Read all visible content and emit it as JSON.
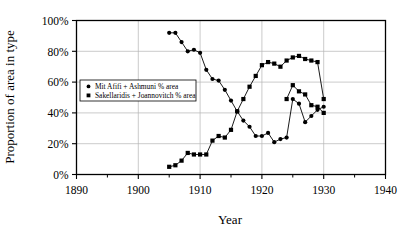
{
  "chart_data": {
    "type": "line",
    "title": "",
    "xlabel": "Year",
    "ylabel": "Proportion of area in type",
    "xlim": [
      1890,
      1940
    ],
    "ylim": [
      0,
      100
    ],
    "xticks": [
      1890,
      1900,
      1910,
      1920,
      1930,
      1940
    ],
    "xtick_labels": [
      "1890",
      "1900",
      "1910",
      "1920",
      "1930",
      "1940"
    ],
    "x_minor_ticks": [
      1895,
      1905,
      1915,
      1925,
      1935
    ],
    "yticks": [
      0,
      20,
      40,
      60,
      80,
      100
    ],
    "ytick_labels": [
      "0%",
      "20%",
      "40%",
      "60%",
      "80%",
      "100%"
    ],
    "grid": true,
    "legend_position": "center-left-inside",
    "marker_color": "#000000",
    "line_color": "#000000",
    "axis_color": "#000000",
    "grid_color": "#b4b4b4",
    "background_color": "#ffffff",
    "series": [
      {
        "name": "Mit Afifi + Ashmuni % area",
        "marker": "circle",
        "x": [
          1905,
          1906,
          1907,
          1908,
          1909,
          1910,
          1911,
          1912,
          1913,
          1914,
          1915,
          1916,
          1917,
          1918,
          1919,
          1920,
          1921,
          1922,
          1923,
          1924,
          1925,
          1926,
          1927,
          1928,
          1929,
          1930
        ],
        "values": [
          92,
          92,
          86,
          80,
          81,
          79,
          68,
          62,
          61,
          55,
          48,
          41,
          35,
          31,
          25,
          25,
          27,
          21,
          23,
          24,
          49,
          46,
          34,
          38,
          42,
          44
        ]
      },
      {
        "name": "Sakellaridis + Joannovitch % area",
        "marker": "square",
        "x": [
          1905,
          1906,
          1907,
          1908,
          1909,
          1910,
          1911,
          1912,
          1913,
          1914,
          1915,
          1916,
          1917,
          1918,
          1919,
          1920,
          1921,
          1922,
          1923,
          1924,
          1925,
          1926,
          1927,
          1928,
          1929,
          1930
        ],
        "values": [
          5,
          6,
          9,
          14,
          13,
          13,
          13,
          22,
          25,
          24,
          29,
          41,
          49,
          57,
          64,
          71,
          73,
          72,
          70,
          74,
          76,
          77,
          75,
          74,
          73,
          49
        ]
      },
      {
        "name": "Sakellaridis + Joannovitch % area tail",
        "marker": "square",
        "x": [
          1924,
          1925,
          1926,
          1927,
          1928,
          1929,
          1930
        ],
        "values": [
          49,
          58,
          54,
          52,
          45,
          44,
          40
        ]
      }
    ],
    "legend": [
      {
        "label": "Mit Afifi + Ashmuni % area",
        "marker": "circle"
      },
      {
        "label": "Sakellaridis + Joannovitch % area",
        "marker": "square"
      }
    ]
  }
}
